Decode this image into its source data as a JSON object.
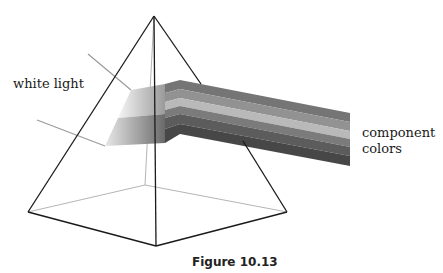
{
  "figure": {
    "caption": "Figure 10.13",
    "labels": {
      "input": "white light",
      "output_line1": "component",
      "output_line2": "colors"
    },
    "colors": {
      "edge_front": "#1a1a1a",
      "edge_back": "#b5b5b5",
      "ray": "#9a9a9a",
      "bands": [
        "#6e6e6e",
        "#8f8f8f",
        "#b8b8b8",
        "#7a7a7a",
        "#5a5a5a",
        "#474747"
      ],
      "incoming_light": "#f4f4f4",
      "incoming_dark": "#9c9c9c"
    }
  }
}
